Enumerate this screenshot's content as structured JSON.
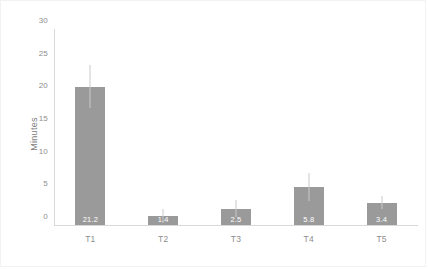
{
  "chart_data": {
    "type": "bar",
    "title": "",
    "xlabel": "",
    "ylabel": "Minutes",
    "categories": [
      "T1",
      "T2",
      "T3",
      "T4",
      "T5"
    ],
    "values": [
      21.2,
      1.4,
      2.5,
      5.8,
      3.4
    ],
    "value_labels": [
      "21.2",
      "1.4",
      "2.5",
      "5.8",
      "3.4"
    ],
    "errors_upper": [
      3.3,
      1.1,
      1.3,
      2.2,
      1.0
    ],
    "errors_lower": [
      3.3,
      1.1,
      1.3,
      2.2,
      1.0
    ],
    "ylim": [
      0,
      30
    ],
    "yticks": [
      0,
      5,
      10,
      15,
      20,
      25,
      30
    ],
    "ytick_labels": [
      "0",
      "5",
      "10",
      "15",
      "20",
      "25",
      "30"
    ],
    "grid": false,
    "legend": false,
    "bar_color": "#9a9a9a",
    "error_color": "#c9c9c9",
    "label_color": "#ffffff",
    "axis_color": "#d9d9d9",
    "tick_text_color": "#8d8d8d",
    "background": "#ffffff"
  }
}
